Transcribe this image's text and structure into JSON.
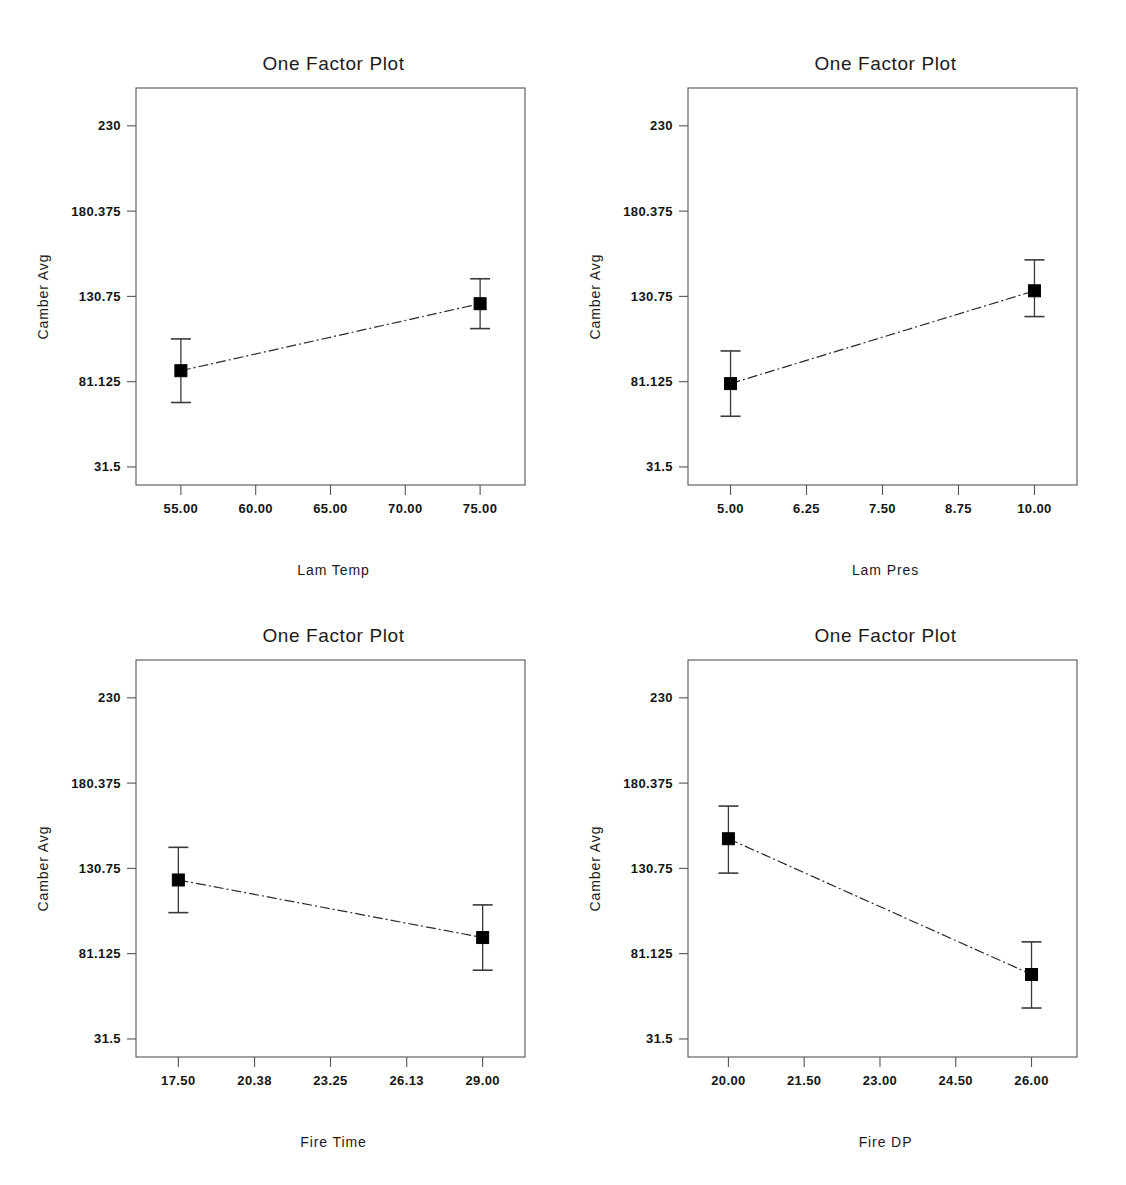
{
  "page": {
    "background_color": "#ffffff",
    "foreground_color": "#000000",
    "panel_count": 4
  },
  "panels": [
    {
      "id": "lam-temp",
      "position": "top-left",
      "title": "One Factor Plot",
      "xlabel": "Lam Temp",
      "ylabel": "Camber Avg"
    },
    {
      "id": "lam-pres",
      "position": "top-right",
      "title": "One Factor Plot",
      "xlabel": "Lam Pres",
      "ylabel": "Camber Avg"
    },
    {
      "id": "fire-time",
      "position": "bottom-left",
      "title": "One Factor Plot",
      "xlabel": "Fire Time",
      "ylabel": "Camber Avg"
    },
    {
      "id": "fire-dp",
      "position": "bottom-right",
      "title": "One Factor Plot",
      "xlabel": "Fire DP",
      "ylabel": "Camber Avg"
    }
  ],
  "chart_data": [
    {
      "type": "line",
      "id": "lam-temp",
      "title": "One Factor Plot",
      "xlabel": "Lam Temp",
      "ylabel": "Camber Avg",
      "x": [
        55.0,
        75.0
      ],
      "values": [
        87.5,
        126.5
      ],
      "error_low": [
        69.0,
        112.0
      ],
      "error_high": [
        106.0,
        141.0
      ],
      "xticks": [
        "55.00",
        "60.00",
        "65.00",
        "70.00",
        "75.00"
      ],
      "xtick_values": [
        55.0,
        60.0,
        65.0,
        70.0,
        75.0
      ],
      "yticks": [
        "230",
        "180.375",
        "130.75",
        "81.125",
        "31.5"
      ],
      "ytick_values": [
        230,
        180.375,
        130.75,
        81.125,
        31.5
      ],
      "xlim": [
        52.0,
        78.0
      ],
      "ylim": [
        21.0,
        252.0
      ],
      "grid": false,
      "legend": "none",
      "marker": "filled-square",
      "line_style": "dash-dot"
    },
    {
      "type": "line",
      "id": "lam-pres",
      "title": "One Factor Plot",
      "xlabel": "Lam Pres",
      "ylabel": "Camber Avg",
      "x": [
        5.0,
        10.0
      ],
      "values": [
        80.0,
        134.0
      ],
      "error_low": [
        61.0,
        119.0
      ],
      "error_high": [
        99.0,
        152.0
      ],
      "xticks": [
        "5.00",
        "6.25",
        "7.50",
        "8.75",
        "10.00"
      ],
      "xtick_values": [
        5.0,
        6.25,
        7.5,
        8.75,
        10.0
      ],
      "yticks": [
        "230",
        "180.375",
        "130.75",
        "81.125",
        "31.5"
      ],
      "ytick_values": [
        230,
        180.375,
        130.75,
        81.125,
        31.5
      ],
      "xlim": [
        4.3,
        10.7
      ],
      "ylim": [
        21.0,
        252.0
      ],
      "grid": false,
      "legend": "none",
      "marker": "filled-square",
      "line_style": "dash-dot"
    },
    {
      "type": "line",
      "id": "fire-time",
      "title": "One Factor Plot",
      "xlabel": "Fire Time",
      "ylabel": "Camber Avg",
      "x": [
        17.5,
        29.0
      ],
      "values": [
        124.0,
        90.5
      ],
      "error_low": [
        105.0,
        71.5
      ],
      "error_high": [
        143.0,
        109.5
      ],
      "xticks": [
        "17.50",
        "20.38",
        "23.25",
        "26.13",
        "29.00"
      ],
      "xtick_values": [
        17.5,
        20.38,
        23.25,
        26.13,
        29.0
      ],
      "yticks": [
        "230",
        "180.375",
        "130.75",
        "81.125",
        "31.5"
      ],
      "ytick_values": [
        230,
        180.375,
        130.75,
        81.125,
        31.5
      ],
      "xlim": [
        15.9,
        30.6
      ],
      "ylim": [
        21.0,
        252.0
      ],
      "grid": false,
      "legend": "none",
      "marker": "filled-square",
      "line_style": "dash-dot"
    },
    {
      "type": "line",
      "id": "fire-dp",
      "title": "One Factor Plot",
      "xlabel": "Fire DP",
      "ylabel": "Camber Avg",
      "x": [
        20.0,
        26.0
      ],
      "values": [
        148.0,
        69.0
      ],
      "error_low": [
        128.0,
        49.5
      ],
      "error_high": [
        167.0,
        88.0
      ],
      "xticks": [
        "20.00",
        "21.50",
        "23.00",
        "24.50",
        "26.00"
      ],
      "xtick_values": [
        20.0,
        21.5,
        23.0,
        24.5,
        26.0
      ],
      "yticks": [
        "230",
        "180.375",
        "130.75",
        "81.125",
        "31.5"
      ],
      "ytick_values": [
        230,
        180.375,
        130.75,
        81.125,
        31.5
      ],
      "xlim": [
        19.2,
        26.9
      ],
      "ylim": [
        21.0,
        252.0
      ],
      "grid": false,
      "legend": "none",
      "marker": "filled-square",
      "line_style": "dash-dot"
    }
  ]
}
